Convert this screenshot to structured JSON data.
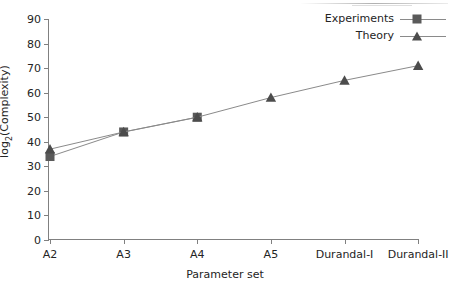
{
  "chart_data": {
    "type": "line",
    "title": "",
    "xlabel": "Parameter set",
    "ylabel": "log2(Complexity)",
    "ylabel_base": "log",
    "ylabel_sub": "2",
    "ylabel_rest": "(Complexity)",
    "categories": [
      "A2",
      "A3",
      "A4",
      "A5",
      "Durandal-I",
      "Durandal-II"
    ],
    "ylim": [
      0,
      90
    ],
    "yticks": [
      0,
      10,
      20,
      30,
      40,
      50,
      60,
      70,
      80,
      90
    ],
    "grid": false,
    "legend_position": "top-right-inside",
    "series": [
      {
        "name": "Experiments",
        "marker": "square",
        "color": "#5a5a5a",
        "line_color": "#8a8a8a",
        "values": [
          34,
          44,
          50,
          null,
          null,
          null
        ]
      },
      {
        "name": "Theory",
        "marker": "triangle",
        "color": "#4c4c4c",
        "line_color": "#8a8a8a",
        "values": [
          37,
          44,
          50,
          58,
          65,
          71
        ]
      }
    ]
  },
  "legend": {
    "items": [
      {
        "label": "Experiments",
        "marker": "square-marker"
      },
      {
        "label": "Theory",
        "marker": "triangle-marker"
      }
    ]
  },
  "axes": {
    "y_tick_labels": [
      "90",
      "80",
      "70",
      "60",
      "50",
      "40",
      "30",
      "20",
      "10",
      "0"
    ],
    "x_tick_labels": [
      "A2",
      "A3",
      "A4",
      "A5",
      "Durandal-I",
      "Durandal-II"
    ],
    "x_title": "Parameter set"
  }
}
